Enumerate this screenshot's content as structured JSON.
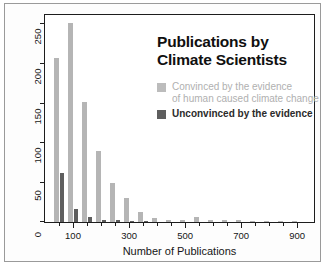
{
  "chart_data": {
    "type": "bar",
    "title": "Publications by Climate Scientists",
    "title_lines": [
      "Publications by",
      "Climate Scientists"
    ],
    "xlabel": "Number of Publications",
    "ylabel": "Number of Researchers",
    "xlim": [
      0,
      960
    ],
    "ylim": [
      0,
      262
    ],
    "yticks": [
      0,
      50,
      100,
      150,
      200,
      250
    ],
    "ytick_labels": [
      "0",
      "50",
      "100",
      "150",
      "200",
      "250"
    ],
    "xticks": [
      100,
      300,
      500,
      700,
      900
    ],
    "xtick_labels": [
      "100",
      "300",
      "500",
      "700",
      "900"
    ],
    "xticks_minor": [
      50,
      150,
      200,
      250,
      350,
      400,
      450,
      550,
      600,
      650,
      750,
      800,
      850
    ],
    "grid": false,
    "legend_position": "upper-right-inside",
    "legend": [
      {
        "name": "Convinced by the evidence of human caused climate change",
        "label_line1": "Convinced by the evidence",
        "label_line2": "of human caused climate change",
        "color": "#b5b5b5"
      },
      {
        "name": "Unconvinced by the evidence",
        "label_line1": "Unconvinced by the evidence",
        "label_line2": "",
        "color": "#5e5e5e"
      }
    ],
    "bin_width": 50,
    "x": [
      50,
      100,
      150,
      200,
      250,
      300,
      350,
      400,
      450,
      500,
      550,
      600,
      650,
      700,
      750,
      800,
      850,
      900
    ],
    "series": [
      {
        "name": "Convinced by the evidence",
        "color": "#b5b5b5",
        "values": [
          208,
          252,
          152,
          90,
          49,
          30,
          13,
          5,
          3,
          3,
          6,
          2,
          2,
          2,
          1,
          1,
          1,
          1
        ]
      },
      {
        "name": "Unconvinced by the evidence",
        "color": "#5e5e5e",
        "values": [
          62,
          16,
          6,
          3,
          2,
          1,
          1,
          0,
          0,
          0,
          0,
          0,
          0,
          0,
          0,
          0,
          0,
          0
        ]
      }
    ]
  },
  "colors": {
    "convinced": "#b5b5b5",
    "unconvinced": "#5e5e5e",
    "axis": "#1d1d1d",
    "text": "#161616",
    "background": "#ffffff",
    "outer_border": "#9a9a9a"
  }
}
